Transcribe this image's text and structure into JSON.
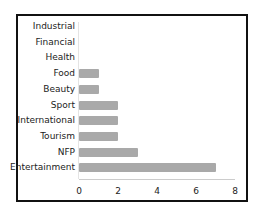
{
  "chart_data": {
    "type": "bar",
    "orientation": "horizontal",
    "title": "",
    "xlabel": "",
    "ylabel": "",
    "categories": [
      "Industrial",
      "Financial",
      "Health",
      "Food",
      "Beauty",
      "Sport",
      "International",
      "Tourism",
      "NFP",
      "Entertainment"
    ],
    "values": [
      0,
      0,
      0,
      1,
      1,
      2,
      2,
      2,
      3,
      7
    ],
    "xlim": [
      0,
      8
    ],
    "xticks": [
      "0",
      "2",
      "4",
      "6",
      "8"
    ],
    "grid": false,
    "legend": null,
    "bar_color": "#a9a9a9"
  }
}
